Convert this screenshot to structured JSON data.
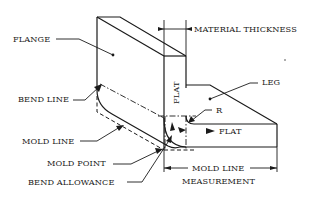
{
  "diagram": {
    "labels": {
      "flange": "FLANGE",
      "material_thickness": "MATERIAL THICKNESS",
      "leg": "LEG",
      "bend_line": "BEND LINE",
      "r": "R",
      "flat_vertical": "FLAT",
      "flat_horizontal": "FLAT",
      "mold_line": "MOLD LINE",
      "mold_point": "MOLD POINT",
      "bend_allowance": "BEND ALLOWANCE",
      "mold_line_measurement_1": "MOLD LINE",
      "mold_line_measurement_2": "MEASUREMENT"
    },
    "colors": {
      "ink": "#1a1a1a",
      "background": "#ffffff"
    }
  }
}
